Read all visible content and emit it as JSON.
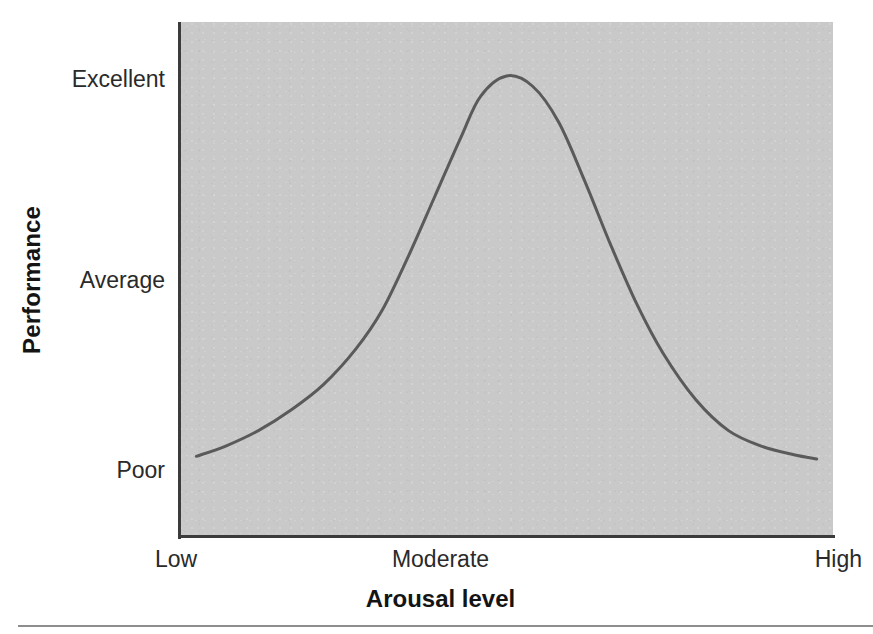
{
  "figure": {
    "background_color": "#ffffff",
    "plot_background_color": "#c9c9c9",
    "axis_color": "#3b3b3b",
    "curve_color": "#5a5a5a",
    "rule_color": "#8d8d8d"
  },
  "axes": {
    "y_title": "Performance",
    "x_title": "Arousal level",
    "y_ticks": [
      {
        "label": "Excellent"
      },
      {
        "label": "Average"
      },
      {
        "label": "Poor"
      }
    ],
    "x_ticks": [
      {
        "label": "Low"
      },
      {
        "label": "Moderate"
      },
      {
        "label": "High"
      }
    ]
  },
  "chart_data": {
    "type": "line",
    "title": "",
    "subtitle": "",
    "xlabel": "Arousal level",
    "ylabel": "Performance",
    "grid": false,
    "legend": false,
    "x_tick_labels": [
      "Low",
      "Moderate",
      "High"
    ],
    "y_tick_labels": [
      "Poor",
      "Average",
      "Excellent"
    ],
    "xlim": [
      0,
      1
    ],
    "ylim": [
      0,
      1
    ],
    "annotations": [],
    "series": [
      {
        "name": "Performance vs arousal",
        "color": "#5a5a5a",
        "line_width": 3,
        "x": [
          0.025,
          0.07,
          0.12,
          0.17,
          0.22,
          0.27,
          0.31,
          0.35,
          0.39,
          0.43,
          0.46,
          0.5,
          0.54,
          0.58,
          0.62,
          0.66,
          0.7,
          0.74,
          0.79,
          0.84,
          0.89,
          0.94,
          0.975
        ],
        "y": [
          0.155,
          0.175,
          0.205,
          0.245,
          0.295,
          0.365,
          0.44,
          0.545,
          0.66,
          0.775,
          0.855,
          0.895,
          0.875,
          0.805,
          0.69,
          0.565,
          0.45,
          0.355,
          0.265,
          0.205,
          0.175,
          0.158,
          0.15
        ]
      }
    ]
  }
}
